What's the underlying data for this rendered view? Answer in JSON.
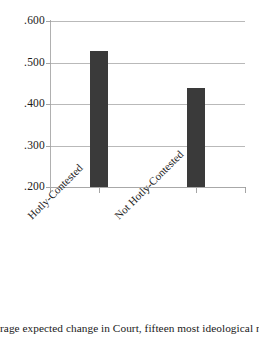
{
  "chart_data": {
    "type": "bar",
    "title": "",
    "xlabel": "",
    "ylabel": "",
    "categories": [
      "Hotly-Contested",
      "Not Hotly-Contested"
    ],
    "values": [
      0.527,
      0.438
    ],
    "ylim": [
      0.2,
      0.6
    ],
    "ytick_labels": [
      ".600",
      ".500",
      ".400",
      ".300",
      ".200"
    ],
    "ytick_values": [
      0.6,
      0.5,
      0.4,
      0.3,
      0.2
    ],
    "grid": true,
    "legend": "none",
    "bar_color": "#3a3a3a",
    "gridline_color": "#b9b9b9",
    "axis_color": "#a5a5a5",
    "background": "#ffffff"
  },
  "caption": {
    "text": "rage expected change in Court, fifteen most ideological nomin"
  }
}
